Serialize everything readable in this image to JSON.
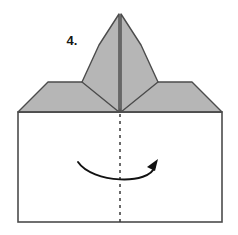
{
  "diagram": {
    "step_label": "4.",
    "colors": {
      "paper_fill": "#ffffff",
      "shaded_fill": "#b6b6b6",
      "outline": "#4c4c4c",
      "crease_line": "#5a5a5a",
      "dashed_line": "#3a3a3a",
      "arrow": "#111111",
      "label_text": "#161616"
    },
    "elements": {
      "base_square": {
        "name": "base-square",
        "label": "Base square panel",
        "x": 18,
        "y": 112,
        "width": 204,
        "height": 110
      },
      "left_flap": {
        "name": "left-flap",
        "label": "Left shaded flap",
        "points": "18,112 48,82 108,82 120,112"
      },
      "right_flap": {
        "name": "right-flap",
        "label": "Right shaded flap",
        "points": "222,112 192,82 132,82 120,112"
      },
      "center_peak_left": {
        "name": "center-peak-left",
        "label": "Left half of raised center point",
        "points": "119,14 119,112 82,82 99,45"
      },
      "center_peak_right": {
        "name": "center-peak-right",
        "label": "Right half of raised center point",
        "points": "121,14 121,112 158,82 141,45"
      },
      "peak_center_crease": {
        "name": "peak-center-crease",
        "label": "Vertical crease on the raised point",
        "x1": 120,
        "y1": 14,
        "x2": 120,
        "y2": 112
      },
      "dashed_center_line": {
        "name": "dashed-center-line",
        "label": "Dashed vertical fold line",
        "x1": 120,
        "y1": 114,
        "x2": 120,
        "y2": 222,
        "dash_pattern": "3 4"
      },
      "fold_arrow": {
        "name": "fold-arrow",
        "label": "Curved fold-over arrow pointing right",
        "path": "M78,162 C92,183 150,186 155,166",
        "head_points": "158,160 149,167 155,170"
      },
      "step_number": {
        "name": "step-number-label",
        "text": "4.",
        "x": 72,
        "y": 45
      }
    }
  }
}
